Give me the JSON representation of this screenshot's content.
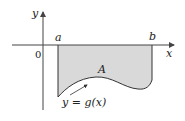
{
  "diagram": {
    "axis_labels": {
      "y": "y",
      "x": "x",
      "origin": "0"
    },
    "points": {
      "a": "a",
      "b": "b"
    },
    "region_label": "A",
    "curve_label": "y = g(x)",
    "colors": {
      "region_fill": "#d9d9d9",
      "stroke": "#333333",
      "axis": "#444444"
    }
  }
}
